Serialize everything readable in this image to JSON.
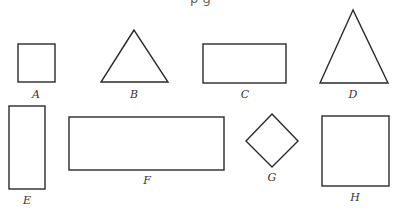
{
  "header": {
    "cut_text": "p                          g"
  },
  "shapes": [
    {
      "id": "A",
      "type": "square",
      "label": "A"
    },
    {
      "id": "B",
      "type": "triangle",
      "label": "B"
    },
    {
      "id": "C",
      "type": "rectangle",
      "label": "C"
    },
    {
      "id": "D",
      "type": "triangle",
      "label": "D"
    },
    {
      "id": "E",
      "type": "rectangle",
      "label": "E"
    },
    {
      "id": "F",
      "type": "rectangle",
      "label": "F"
    },
    {
      "id": "G",
      "type": "rhombus",
      "label": "G"
    },
    {
      "id": "H",
      "type": "square",
      "label": "H"
    }
  ],
  "colors": {
    "stroke": "#2a2a2a"
  }
}
